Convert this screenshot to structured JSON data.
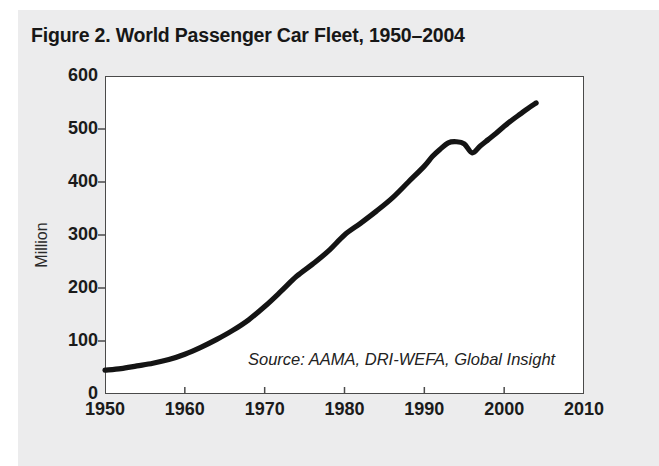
{
  "figure": {
    "title": "Figure 2. World Passenger Car Fleet, 1950–2004",
    "source_note": "Source: AAMA, DRI-WEFA, Global Insight",
    "background_color": "#ececed",
    "plot_background_color": "#ffffff",
    "line_color": "#141414",
    "axis_color": "#4a4a4a"
  },
  "chart_data": {
    "type": "line",
    "title": "Figure 2. World Passenger Car Fleet, 1950–2004",
    "xlabel": "",
    "ylabel": "Million",
    "xlim": [
      1950,
      2010
    ],
    "ylim": [
      0,
      600
    ],
    "xticks": [
      1950,
      1960,
      1970,
      1980,
      1990,
      2000,
      2010
    ],
    "xtick_labels": [
      "1950",
      "1960",
      "1970",
      "1980",
      "1990",
      "2000",
      "2010"
    ],
    "yticks": [
      0,
      100,
      200,
      300,
      400,
      500,
      600
    ],
    "ytick_labels": [
      "0",
      "100",
      "200",
      "300",
      "400",
      "500",
      "600"
    ],
    "grid": false,
    "legend": false,
    "annotations": [
      "Source: AAMA, DRI-WEFA, Global Insight"
    ],
    "series": [
      {
        "name": "World passenger car fleet",
        "units": "million",
        "x": [
          1950,
          1952,
          1954,
          1956,
          1958,
          1960,
          1962,
          1964,
          1966,
          1968,
          1970,
          1972,
          1974,
          1976,
          1978,
          1980,
          1982,
          1984,
          1986,
          1988,
          1990,
          1991,
          1992,
          1993,
          1994,
          1995,
          1996,
          1997,
          1998,
          1999,
          2000,
          2001,
          2002,
          2003,
          2004
        ],
        "values": [
          45,
          48,
          53,
          58,
          65,
          75,
          88,
          103,
          120,
          140,
          165,
          193,
          222,
          245,
          270,
          300,
          322,
          345,
          370,
          400,
          430,
          448,
          462,
          474,
          476,
          472,
          455,
          468,
          480,
          492,
          505,
          517,
          528,
          539,
          549
        ]
      }
    ]
  }
}
